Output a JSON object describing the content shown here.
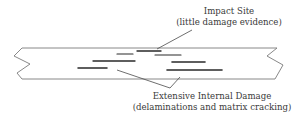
{
  "diagram": {
    "impact_label": {
      "line1": "Impact Site",
      "line2": "(little damage evidence)"
    },
    "damage_label": {
      "line1": "Extensive Internal Damage",
      "line2": "(delaminations and matrix cracking)"
    },
    "colors": {
      "outline": "#777777",
      "cracks": "#2a2a2a",
      "text": "#3a3a3a"
    }
  }
}
